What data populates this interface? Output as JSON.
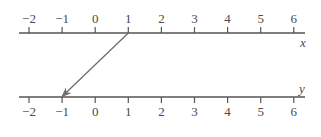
{
  "diagram": {
    "type": "mapping-diagram",
    "colors": {
      "axis": "#555555",
      "arrow": "#6e6e6e",
      "text": "#4a4a4a",
      "background": "#ffffff"
    },
    "top_axis": {
      "name": "x",
      "ticks": [
        -2,
        -1,
        0,
        1,
        2,
        3,
        4,
        5,
        6
      ],
      "tick_labels": [
        "−2",
        "−1",
        "0",
        "1",
        "2",
        "3",
        "4",
        "5",
        "6"
      ],
      "label_position": "above"
    },
    "bottom_axis": {
      "name": "y",
      "ticks": [
        -2,
        -1,
        0,
        1,
        2,
        3,
        4,
        5,
        6
      ],
      "tick_labels": [
        "−2",
        "−1",
        "0",
        "1",
        "2",
        "3",
        "4",
        "5",
        "6"
      ],
      "label_position": "below"
    },
    "mappings": [
      {
        "from": 1,
        "to": -1
      }
    ]
  }
}
